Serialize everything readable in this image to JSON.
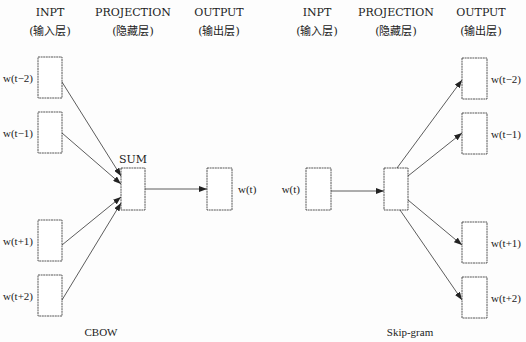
{
  "cbow": {
    "caption": "CBOW",
    "headers": [
      {
        "title": "INPT",
        "subtitle": "(输入层)"
      },
      {
        "title": "PROJECTION",
        "subtitle": "(隐藏层)"
      },
      {
        "title": "OUTPUT",
        "subtitle": "(输出层)"
      }
    ],
    "inputs": [
      "w(t−2)",
      "w(t−1)",
      "w(t+1)",
      "w(t+2)"
    ],
    "projection_label": "SUM",
    "output": "w(t)"
  },
  "skipgram": {
    "caption": "Skip-gram",
    "headers": [
      {
        "title": "INPT",
        "subtitle": "(输入层)"
      },
      {
        "title": "PROJECTION",
        "subtitle": "(隐藏层)"
      },
      {
        "title": "OUTPUT",
        "subtitle": "(输出层)"
      }
    ],
    "input": "w(t)",
    "outputs": [
      "w(t−2)",
      "w(t−1)",
      "w(t+1)",
      "w(t+2)"
    ]
  }
}
